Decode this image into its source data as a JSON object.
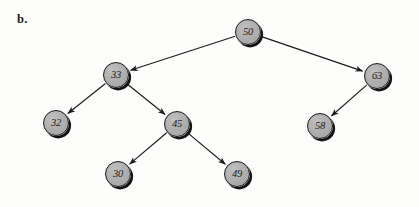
{
  "figure": {
    "label": "b.",
    "label_x": 17,
    "label_y": 13,
    "type": "binary-search-tree-diagram",
    "width": 419,
    "height": 207,
    "background_color": "#fdfdfc",
    "node_fill_color": "#ababab",
    "node_border_color": "#171717",
    "edge_color": "#1c1c1c",
    "node_diameter": 26
  },
  "tree": {
    "root": "50",
    "nodes": [
      {
        "id": "n50",
        "value": "50",
        "cx": 248,
        "cy": 32,
        "level": 0
      },
      {
        "id": "n33",
        "value": "33",
        "cx": 116,
        "cy": 75,
        "level": 1
      },
      {
        "id": "n63",
        "value": "63",
        "cx": 377,
        "cy": 76,
        "level": 1
      },
      {
        "id": "n32",
        "value": "32",
        "cx": 56,
        "cy": 123,
        "level": 2
      },
      {
        "id": "n45",
        "value": "45",
        "cx": 177,
        "cy": 124,
        "level": 2
      },
      {
        "id": "n58",
        "value": "58",
        "cx": 320,
        "cy": 126,
        "level": 2
      },
      {
        "id": "n30",
        "value": "30",
        "cx": 118,
        "cy": 174,
        "level": 3
      },
      {
        "id": "n49",
        "value": "49",
        "cx": 237,
        "cy": 174,
        "level": 3
      }
    ],
    "edges": [
      {
        "from": "n50",
        "to": "n33",
        "side": "left",
        "directed": true
      },
      {
        "from": "n50",
        "to": "n63",
        "side": "right",
        "directed": true
      },
      {
        "from": "n33",
        "to": "n32",
        "side": "left",
        "directed": true
      },
      {
        "from": "n33",
        "to": "n45",
        "side": "right",
        "directed": true
      },
      {
        "from": "n45",
        "to": "n30",
        "side": "left",
        "directed": true
      },
      {
        "from": "n45",
        "to": "n49",
        "side": "right",
        "directed": true
      },
      {
        "from": "n63",
        "to": "n58",
        "side": "left",
        "directed": true
      }
    ]
  }
}
